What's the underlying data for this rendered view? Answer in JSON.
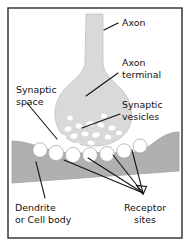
{
  "figure": {
    "frame": {
      "x": 8,
      "y": 8,
      "width": 174,
      "height": 230
    }
  },
  "colors": {
    "background": "#ffffff",
    "frame_border": "#2b2b2b",
    "axon_terminal_fill": "#d9d9d9",
    "axon_terminal_stroke": "#c2c2c2",
    "dendrite_fill": "#b0b0b0",
    "dendrite_stroke": "#a2a2a2",
    "vesicle_fill": "#ffffff",
    "receptor_site_fill": "#ffffff",
    "label_text": "#111111",
    "leader_line": "#111111"
  },
  "labels": [
    {
      "id": "axon",
      "name": "axon-label",
      "lines": [
        "Axon"
      ],
      "x": 122,
      "y": 26,
      "anchor": "start"
    },
    {
      "id": "axon_terminal",
      "name": "axon-terminal-label",
      "lines": [
        "Axon",
        "terminal"
      ],
      "x": 122,
      "y": 66,
      "anchor": "start"
    },
    {
      "id": "synaptic_vesicles",
      "name": "synaptic-vesicles-label",
      "lines": [
        "Synaptic",
        "vesicles"
      ],
      "x": 122,
      "y": 108,
      "anchor": "start"
    },
    {
      "id": "synaptic_space",
      "name": "synaptic-space-label",
      "lines": [
        "Synaptic",
        "space"
      ],
      "x": 16,
      "y": 93,
      "anchor": "start"
    },
    {
      "id": "dendrite_or_cell_body",
      "name": "dendrite-or-cell-body-label",
      "lines": [
        "Dendrite",
        "or Cell body"
      ],
      "x": 15,
      "y": 211,
      "anchor": "start"
    },
    {
      "id": "receptor_sites",
      "name": "receptor-sites-label",
      "lines": [
        "Receptor",
        "sites"
      ],
      "x": 145,
      "y": 211,
      "anchor": "middle"
    }
  ],
  "leader_lines": [
    {
      "id": "axon_leader",
      "name": "axon-leader-line",
      "points": "118,23 104,30"
    },
    {
      "id": "axon_terminal_leader",
      "name": "axon-terminal-leader-line",
      "points": "118,73 86,96"
    },
    {
      "id": "synaptic_vesicles_leader",
      "name": "synaptic-vesicles-leader-line",
      "points": "120,114 82,128"
    },
    {
      "id": "synaptic_space_leader",
      "name": "synaptic-space-leader-line",
      "points": "27,103 57,139"
    },
    {
      "id": "dendrite_leader",
      "name": "dendrite-leader-line",
      "points": "45,198 36,162"
    },
    {
      "id": "receptor_leader_1",
      "name": "receptor-leader-line-1",
      "points": "143,193 64,160"
    },
    {
      "id": "receptor_leader_2",
      "name": "receptor-leader-line-2",
      "points": "143,193 88,158"
    },
    {
      "id": "receptor_leader_3",
      "name": "receptor-leader-line-3",
      "points": "143,193 113,155"
    },
    {
      "id": "receptor_leader_4",
      "name": "receptor-leader-line-4",
      "points": "143,193 132,150"
    }
  ],
  "shapes": {
    "axon_terminal": {
      "name": "axon-terminal-shape",
      "path": "M 86,14 L 103,14 L 103,62 C 103,74 113,80 122,90 C 130,99 133,110 131,122 C 128,136 114,145 97,146 C 80,147 64,141 58,128 C 52,115 55,101 63,91 C 71,81 85,74 85,62 Z"
    },
    "dendrite": {
      "name": "dendrite-shape",
      "path": "M 12,141 L 12,183 L 179,171 L 179,132 C 168,132 160,138 152,144 C 144,150 135,153 126,153 C 112,153 98,152 84,153 C 70,154 56,152 44,148 C 34,145 23,141 12,141 Z"
    }
  },
  "vesicles": [
    {
      "cx": 68,
      "cy": 129,
      "rx": 3.6,
      "ry": 2.6,
      "rot": -18
    },
    {
      "cx": 79,
      "cy": 126,
      "rx": 3.4,
      "ry": 2.5,
      "rot": 10
    },
    {
      "cx": 90,
      "cy": 124,
      "rx": 3.8,
      "ry": 2.7,
      "rot": -8
    },
    {
      "cx": 101,
      "cy": 125,
      "rx": 3.3,
      "ry": 2.4,
      "rot": 22
    },
    {
      "cx": 112,
      "cy": 128,
      "rx": 3.5,
      "ry": 2.5,
      "rot": -12
    },
    {
      "cx": 63,
      "cy": 137,
      "rx": 3.2,
      "ry": 2.3,
      "rot": 14
    },
    {
      "cx": 74,
      "cy": 136,
      "rx": 3.6,
      "ry": 2.6,
      "rot": -20
    },
    {
      "cx": 85,
      "cy": 134,
      "rx": 3.4,
      "ry": 2.5,
      "rot": 6
    },
    {
      "cx": 96,
      "cy": 135,
      "rx": 3.7,
      "ry": 2.6,
      "rot": -14
    },
    {
      "cx": 108,
      "cy": 137,
      "rx": 3.3,
      "ry": 2.4,
      "rot": 18
    },
    {
      "cx": 119,
      "cy": 133,
      "rx": 3.1,
      "ry": 2.3,
      "rot": -6
    },
    {
      "cx": 70,
      "cy": 118,
      "rx": 3.0,
      "ry": 2.2,
      "rot": 8
    },
    {
      "cx": 104,
      "cy": 116,
      "rx": 3.0,
      "ry": 2.2,
      "rot": -10
    },
    {
      "cx": 91,
      "cy": 143,
      "rx": 3.4,
      "ry": 2.4,
      "rot": 12
    },
    {
      "cx": 77,
      "cy": 145,
      "rx": 3.0,
      "ry": 2.2,
      "rot": -8
    }
  ],
  "receptor_sites": [
    {
      "cx": 40,
      "cy": 150,
      "r": 7.2
    },
    {
      "cx": 56,
      "cy": 153,
      "r": 7.6
    },
    {
      "cx": 73,
      "cy": 155,
      "r": 7.6
    },
    {
      "cx": 90,
      "cy": 155,
      "r": 7.4
    },
    {
      "cx": 107,
      "cy": 154,
      "r": 7.4
    },
    {
      "cx": 124,
      "cy": 151,
      "r": 7.2
    },
    {
      "cx": 140,
      "cy": 146,
      "r": 7.0
    }
  ]
}
